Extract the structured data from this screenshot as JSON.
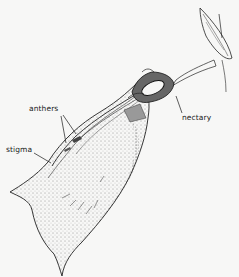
{
  "figure": {
    "labels": {
      "anthers": "anthers",
      "stigma": "stigma",
      "nectary": "nectary"
    },
    "colors": {
      "background": "#f7f7f6",
      "ink": "#1a1a1a"
    }
  }
}
